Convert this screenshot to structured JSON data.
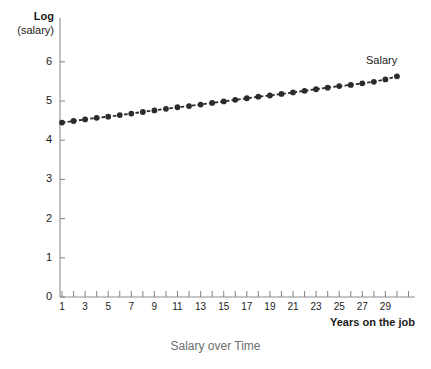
{
  "caption": "Salary over Time",
  "axes": {
    "y_title_line1": "Log",
    "y_title_line2": "(salary)",
    "x_title": "Years on the job",
    "y_ticks": [
      "0",
      "1",
      "2",
      "3",
      "4",
      "5",
      "6"
    ],
    "x_ticks": [
      "1",
      "3",
      "5",
      "7",
      "9",
      "11",
      "13",
      "15",
      "17",
      "19",
      "21",
      "23",
      "25",
      "27",
      "29"
    ]
  },
  "series_label": "Salary",
  "colors": {
    "marker": "#2b2b2b",
    "line": "#2b2b2b",
    "axis": "#8c8c8c",
    "text": "#1a1a1a",
    "caption": "#6e6e6e",
    "background": "#ffffff"
  },
  "chart_data": {
    "type": "line",
    "title": "Salary over Time",
    "xlabel": "Years on the job",
    "ylabel": "Log (salary)",
    "xlim": [
      0,
      31
    ],
    "ylim": [
      0,
      6.4
    ],
    "grid": false,
    "legend": "inline-right",
    "marker": "filled-circle",
    "linestyle": "dashed",
    "series": [
      {
        "name": "Salary",
        "x": [
          1,
          2,
          3,
          4,
          5,
          6,
          7,
          8,
          9,
          10,
          11,
          12,
          13,
          14,
          15,
          16,
          17,
          18,
          19,
          20,
          21,
          22,
          23,
          24,
          25,
          26,
          27,
          28,
          29,
          30
        ],
        "values": [
          4.45,
          4.49,
          4.53,
          4.57,
          4.6,
          4.64,
          4.68,
          4.72,
          4.76,
          4.8,
          4.84,
          4.87,
          4.91,
          4.95,
          4.99,
          5.03,
          5.07,
          5.11,
          5.14,
          5.18,
          5.22,
          5.26,
          5.3,
          5.34,
          5.38,
          5.41,
          5.45,
          5.49,
          5.55,
          5.63
        ]
      }
    ]
  }
}
